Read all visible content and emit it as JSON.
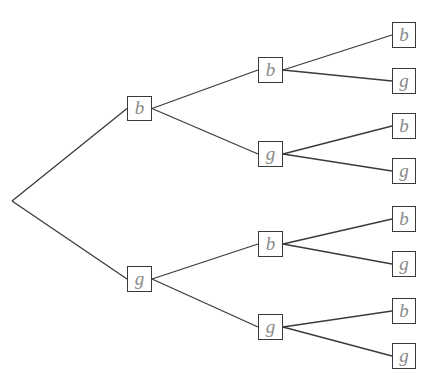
{
  "diagram": {
    "type": "probability-tree",
    "colors": {
      "edge": "#3a3a3a",
      "box_border": "#3a3a3a",
      "label_text": "#8a8a8a",
      "background": "#ffffff"
    },
    "root": {
      "x": 12,
      "y": 201
    },
    "levels": [
      {
        "level": 1,
        "nodes": [
          {
            "id": "n1",
            "label": "b",
            "x": 127,
            "y": 96,
            "w": 25,
            "h": 25,
            "parent": "root"
          },
          {
            "id": "n2",
            "label": "g",
            "x": 127,
            "y": 266,
            "w": 25,
            "h": 26,
            "parent": "root"
          }
        ]
      },
      {
        "level": 2,
        "nodes": [
          {
            "id": "n11",
            "label": "b",
            "x": 258,
            "y": 57,
            "w": 25,
            "h": 26,
            "parent": "n1"
          },
          {
            "id": "n12",
            "label": "g",
            "x": 258,
            "y": 141,
            "w": 25,
            "h": 26,
            "parent": "n1"
          },
          {
            "id": "n21",
            "label": "b",
            "x": 258,
            "y": 231,
            "w": 25,
            "h": 26,
            "parent": "n2"
          },
          {
            "id": "n22",
            "label": "g",
            "x": 258,
            "y": 314,
            "w": 25,
            "h": 26,
            "parent": "n2"
          }
        ]
      },
      {
        "level": 3,
        "nodes": [
          {
            "id": "n111",
            "label": "b",
            "x": 392,
            "y": 22,
            "w": 24,
            "h": 26,
            "parent": "n11"
          },
          {
            "id": "n112",
            "label": "g",
            "x": 392,
            "y": 68,
            "w": 24,
            "h": 26,
            "parent": "n11"
          },
          {
            "id": "n121",
            "label": "b",
            "x": 392,
            "y": 113,
            "w": 24,
            "h": 26,
            "parent": "n12"
          },
          {
            "id": "n122",
            "label": "g",
            "x": 392,
            "y": 158,
            "w": 24,
            "h": 26,
            "parent": "n12"
          },
          {
            "id": "n211",
            "label": "b",
            "x": 392,
            "y": 206,
            "w": 24,
            "h": 26,
            "parent": "n21"
          },
          {
            "id": "n212",
            "label": "g",
            "x": 392,
            "y": 251,
            "w": 24,
            "h": 26,
            "parent": "n21"
          },
          {
            "id": "n221",
            "label": "b",
            "x": 392,
            "y": 298,
            "w": 24,
            "h": 26,
            "parent": "n22"
          },
          {
            "id": "n222",
            "label": "g",
            "x": 392,
            "y": 343,
            "w": 24,
            "h": 26,
            "parent": "n22"
          }
        ]
      }
    ]
  }
}
